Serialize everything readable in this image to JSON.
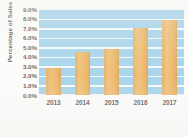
{
  "chart_data": {
    "type": "bar",
    "title": "",
    "subtitle": "",
    "xlabel": "",
    "ylabel": "Percentage of Sales",
    "categories": [
      "2013",
      "2014",
      "2015",
      "2016",
      "2017"
    ],
    "values": [
      2.8,
      4.5,
      4.8,
      7.0,
      7.8
    ],
    "value_labels": [
      "2.8%",
      "4.5%",
      "4.8%",
      "7.0%",
      "7.8%"
    ],
    "ylim": [
      0.0,
      9.0
    ],
    "ytick_values": [
      0.0,
      1.0,
      2.0,
      3.0,
      4.0,
      5.0,
      6.0,
      7.0,
      8.0,
      9.0
    ],
    "ytick_labels": [
      "0.0%",
      "1.0%",
      "2.0%",
      "3.0%",
      "4.0%",
      "5.0%",
      "6.0%",
      "7.0%",
      "8.0%",
      "9.0%"
    ],
    "grid": true,
    "grid_color": "#ffffff",
    "legend": false,
    "legend_position": "none",
    "series": [
      {
        "name": "Percentage of Sales",
        "values": [
          2.8,
          4.5,
          4.8,
          7.0,
          7.8
        ],
        "color": "#e8a341"
      }
    ],
    "plot_background_color": "#8ec9e8",
    "figure_background_color": "#fdfdfc",
    "bar_color": "#e8a341",
    "text_color": "#2b2b2b"
  }
}
